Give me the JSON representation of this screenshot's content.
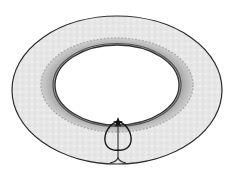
{
  "diagram": {
    "type": "annular-ring-with-seam-loop",
    "labels": [],
    "colors": {
      "background": "#ffffff",
      "outer_ring_fill": "#e9e9e9",
      "middle_band_fill": "#b8b8b8",
      "inner_edge_band": "#8c8c8c",
      "hole_fill": "#ffffff",
      "stroke": "#222222"
    },
    "outer_ellipse": {
      "cx": 117,
      "cy": 90,
      "rx": 105,
      "ry": 74
    },
    "middle_band": {
      "cx": 117,
      "cy": 85,
      "rx": 76,
      "ry": 47
    },
    "inner_hole": {
      "cx": 117,
      "cy": 85,
      "rx": 62,
      "ry": 40
    },
    "seam_loop": {
      "top": [
        118,
        121
      ],
      "bottom_y": 150,
      "left_x": 104,
      "right_x": 132
    },
    "seam_line": {
      "x": 118,
      "y1": 121,
      "y2": 163
    }
  }
}
